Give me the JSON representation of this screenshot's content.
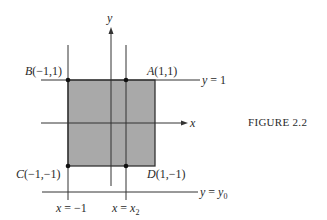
{
  "figure": {
    "caption": "FIGURE 2.2",
    "axis_labels": {
      "x": "x",
      "y": "y"
    },
    "points": {
      "A": {
        "name": "A",
        "coords": "(1,1)"
      },
      "B": {
        "name": "B",
        "coords": "(−1,1)"
      },
      "C": {
        "name": "C",
        "coords": "(−1,−1)"
      },
      "D": {
        "name": "D",
        "coords": "(1,−1)"
      }
    },
    "lines": {
      "y1": {
        "lhs": "y",
        "eq": " = 1"
      },
      "y0": {
        "lhs": "y",
        "eq": " = ",
        "rhs": "y",
        "sub": "0"
      },
      "xm1": {
        "lhs": "x",
        "eq": " = −1"
      },
      "x2": {
        "lhs": "x",
        "eq": " = ",
        "rhs": "x",
        "sub": "2"
      }
    },
    "colors": {
      "square_fill": "#a9a9a9",
      "line": "#333333"
    }
  }
}
